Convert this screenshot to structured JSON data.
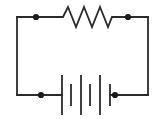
{
  "figure": {
    "width": 168,
    "height": 119,
    "background_color": "#ffffff",
    "line_color": "#2b2b2b",
    "node_color": "#1a1a1a",
    "line_width": 1.8
  },
  "circuit": {
    "loop": {
      "name": "outer-conductor-loop",
      "left_x": 17,
      "right_x": 148,
      "top_y": 17,
      "bottom_y": 95
    },
    "wires": [
      {
        "name": "top-wire-left-segment",
        "x1": 17,
        "y1": 17,
        "x2": 59,
        "y2": 17
      },
      {
        "name": "top-wire-right-segment",
        "x1": 113,
        "y1": 17,
        "x2": 148,
        "y2": 17
      },
      {
        "name": "left-wire",
        "x1": 17,
        "y1": 17,
        "x2": 17,
        "y2": 95
      },
      {
        "name": "right-wire",
        "x1": 148,
        "y1": 17,
        "x2": 148,
        "y2": 95
      },
      {
        "name": "bottom-wire-left-segment",
        "x1": 17,
        "y1": 95,
        "x2": 62,
        "y2": 95
      },
      {
        "name": "bottom-wire-right-segment",
        "x1": 110,
        "y1": 95,
        "x2": 148,
        "y2": 95
      }
    ],
    "resistor": {
      "name": "resistor",
      "symbol": "zigzag",
      "branch": "top",
      "start_x": 59,
      "end_x": 113,
      "center_y": 17,
      "peak_y": 7,
      "valley_y": 27,
      "peaks": 3,
      "valleys": 3,
      "points": "59,17 63,17 68,7 76,27 84,7 92,27 100,7 108,27 112,17 113,17"
    },
    "battery": {
      "name": "battery",
      "symbol": "multi-cell-battery",
      "branch": "bottom",
      "center_y": 95,
      "cells": 3,
      "plate_count": 6,
      "plates": [
        {
          "name": "battery-plate-long-1",
          "x": 62,
          "half_height": 20,
          "type": "long",
          "polarity": "positive"
        },
        {
          "name": "battery-plate-short-1",
          "x": 71,
          "half_height": 11,
          "type": "short",
          "polarity": "negative"
        },
        {
          "name": "battery-plate-long-2",
          "x": 81,
          "half_height": 20,
          "type": "long",
          "polarity": "positive"
        },
        {
          "name": "battery-plate-short-2",
          "x": 90,
          "half_height": 11,
          "type": "short",
          "polarity": "negative"
        },
        {
          "name": "battery-plate-long-3",
          "x": 100,
          "half_height": 20,
          "type": "long",
          "polarity": "positive"
        },
        {
          "name": "battery-plate-short-3",
          "x": 110,
          "half_height": 11,
          "type": "short",
          "polarity": "negative"
        }
      ]
    },
    "nodes": [
      {
        "name": "node-top-left",
        "x": 36,
        "y": 17,
        "radius": 3.1
      },
      {
        "name": "node-top-right",
        "x": 128,
        "y": 17,
        "radius": 3.1
      },
      {
        "name": "node-bottom-left",
        "x": 41,
        "y": 95,
        "radius": 3.1
      },
      {
        "name": "node-bottom-right",
        "x": 115,
        "y": 95,
        "radius": 3.1
      }
    ]
  }
}
